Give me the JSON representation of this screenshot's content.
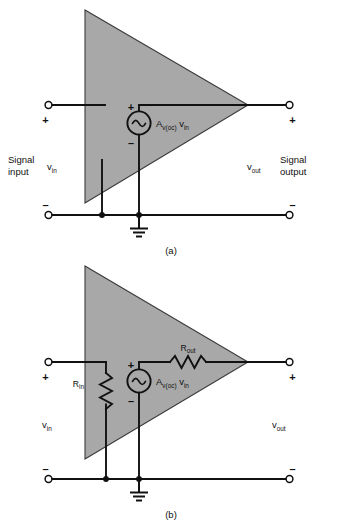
{
  "figure": {
    "title_caption": "",
    "background_color": "#ffffff",
    "amplifier_fill_color": "#a8a8a8",
    "line_color": "#111111"
  },
  "diagram_a": {
    "caption": "(a)",
    "left_block": {
      "line1": "Signal",
      "line2": "input"
    },
    "right_block": {
      "line1": "Signal",
      "line2": "output"
    },
    "input_voltage": {
      "base": "v",
      "sub": "in"
    },
    "output_voltage": {
      "base": "v",
      "sub": "out"
    },
    "source_label": {
      "base": "A",
      "sub": "v(oc)",
      "suffix_base": "v",
      "suffix_sub": "in"
    },
    "terminals": {
      "input_plus": "+",
      "input_minus": "–",
      "output_plus": "+",
      "output_minus": "–"
    },
    "source_polarity": {
      "plus": "+",
      "minus": "–"
    },
    "ground_symbol": "ground-earth"
  },
  "diagram_b": {
    "caption": "(b)",
    "input_voltage": {
      "base": "v",
      "sub": "in"
    },
    "output_voltage": {
      "base": "v",
      "sub": "out"
    },
    "source_label": {
      "base": "A",
      "sub": "v(oc)",
      "suffix_base": "v",
      "suffix_sub": "in"
    },
    "resistor_input": {
      "base": "R",
      "sub": "in"
    },
    "resistor_output": {
      "base": "R",
      "sub": "out"
    },
    "terminals": {
      "input_plus": "+",
      "input_minus": "–",
      "output_plus": "+",
      "output_minus": "–"
    },
    "source_polarity": {
      "plus": "+",
      "minus": "–"
    },
    "ground_symbol": "ground-earth"
  }
}
